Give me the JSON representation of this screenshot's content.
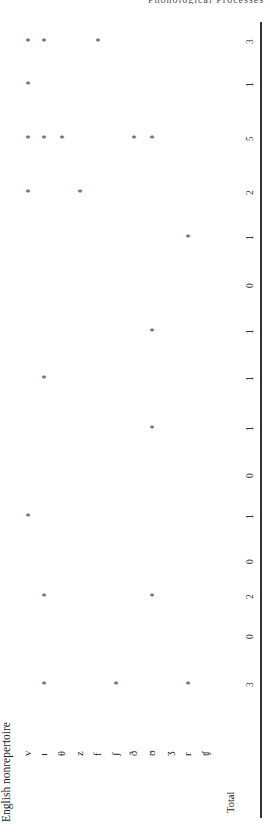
{
  "table": {
    "running_head": "Phonological Processes",
    "caption": "English nonrepertoire",
    "mark_symbol": "*",
    "row_labels": [
      "v",
      "ɪ",
      "θ",
      "z",
      "f",
      "ʃ",
      "ð",
      "ʊ",
      "ʒ",
      "r",
      "ʧ"
    ],
    "total_label": "Total",
    "columns": [
      {
        "total": "3",
        "marks": [
          "ɪ",
          "ʃ",
          "r"
        ]
      },
      {
        "total": "0",
        "marks": []
      },
      {
        "total": "2",
        "marks": [
          "ɪ",
          "ʊ"
        ]
      },
      {
        "total": "0",
        "marks": []
      },
      {
        "total": "1",
        "marks": [
          "v"
        ]
      },
      {
        "total": "0",
        "marks": []
      },
      {
        "total": "1",
        "marks": [
          "ʊ"
        ]
      },
      {
        "total": "1",
        "marks": [
          "ɪ"
        ]
      },
      {
        "total": "1",
        "marks": [
          "ʊ"
        ]
      },
      {
        "total": "0",
        "marks": []
      },
      {
        "total": "1",
        "marks": [
          "r"
        ]
      },
      {
        "total": "2",
        "marks": [
          "v",
          "z"
        ]
      },
      {
        "total": "5",
        "marks": [
          "v",
          "ɪ",
          "θ",
          "ð",
          "ʊ"
        ]
      },
      {
        "total": "1",
        "marks": [
          "v"
        ]
      },
      {
        "total": "3",
        "marks": [
          "v",
          "ɪ",
          "f"
        ]
      }
    ]
  }
}
